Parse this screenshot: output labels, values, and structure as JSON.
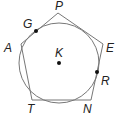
{
  "diagram": {
    "colors": {
      "stroke": "#777777",
      "point": "#111111",
      "label": "#222222"
    },
    "polygon": {
      "vertices": [
        {
          "id": "P",
          "label": "P",
          "x": 58,
          "y": 13,
          "lx": 55,
          "ly": 10
        },
        {
          "id": "E",
          "label": "E",
          "x": 103,
          "y": 44,
          "lx": 106,
          "ly": 52
        },
        {
          "id": "N",
          "label": "N",
          "x": 91,
          "y": 100,
          "lx": 83,
          "ly": 113
        },
        {
          "id": "T",
          "label": "T",
          "x": 32,
          "y": 100,
          "lx": 27,
          "ly": 113
        },
        {
          "id": "A",
          "label": "A",
          "x": 21,
          "y": 44,
          "lx": 4,
          "ly": 52
        }
      ]
    },
    "circle": {
      "cx": 59,
      "cy": 63,
      "r": 40
    },
    "points": [
      {
        "id": "K",
        "label": "K",
        "x": 59,
        "y": 63,
        "lx": 55,
        "ly": 57
      },
      {
        "id": "G",
        "label": "G",
        "x": 36,
        "y": 31,
        "lx": 23,
        "ly": 28
      },
      {
        "id": "R",
        "label": "R",
        "x": 97,
        "y": 72,
        "lx": 101,
        "ly": 85
      }
    ]
  }
}
